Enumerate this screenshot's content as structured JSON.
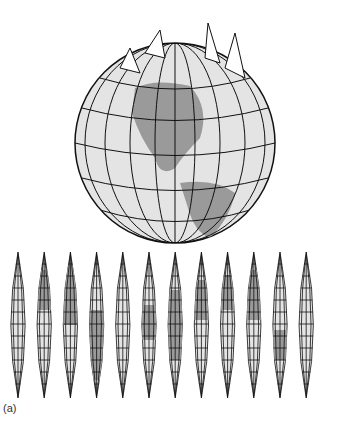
{
  "figure": {
    "label": "(a)",
    "globe": {
      "description": "Globe with gores peeling off at the north pole, showing the Americas",
      "land_color": "#9a9a9a",
      "sea_color": "#e4e4e4",
      "grid_color": "#111111"
    },
    "gores": {
      "count": 12,
      "description": "Interrupted sinusoidal gore projection of the world map",
      "land_color": "#9a9a9a",
      "sea_color": "#e4e4e4",
      "grid_color": "#111111"
    }
  }
}
